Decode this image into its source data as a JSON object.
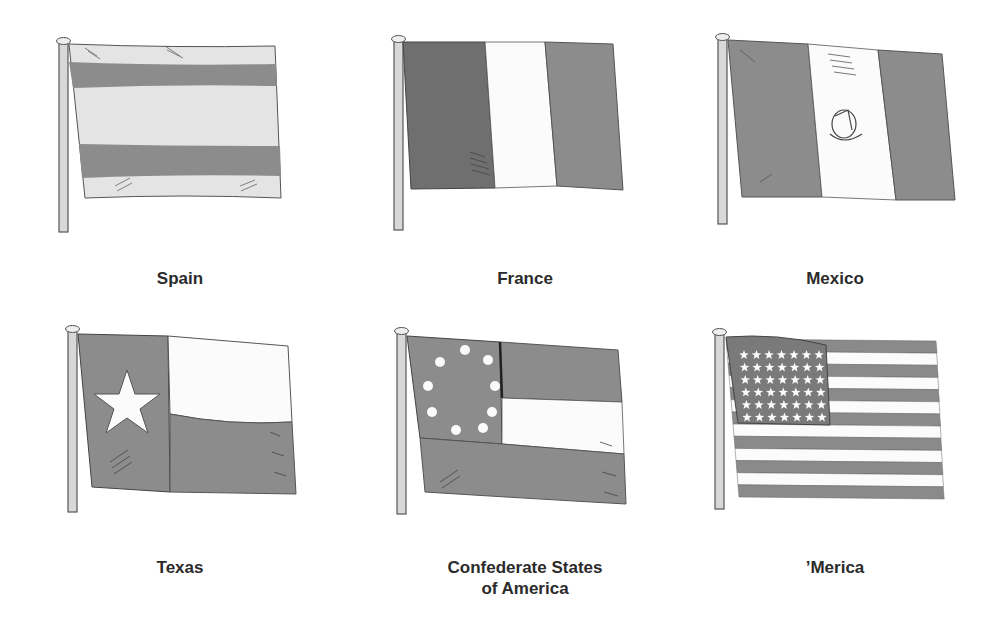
{
  "colors": {
    "dark": "#8a8a8a",
    "darker": "#6f6f6f",
    "light": "#e2e2e2",
    "white": "#fbfbfb",
    "outline": "#555555",
    "pole": "#d8d8d8"
  },
  "flags": [
    {
      "id": "spain",
      "label": "Spain"
    },
    {
      "id": "france",
      "label": "France"
    },
    {
      "id": "mexico",
      "label": "Mexico"
    },
    {
      "id": "texas",
      "label": "Texas"
    },
    {
      "id": "csa",
      "label_line1": "Confederate States",
      "label_line2": "of America"
    },
    {
      "id": "usa",
      "label": "’Merica",
      "stars_rows": 6,
      "stars_cols": 7,
      "stripes": 13
    }
  ]
}
